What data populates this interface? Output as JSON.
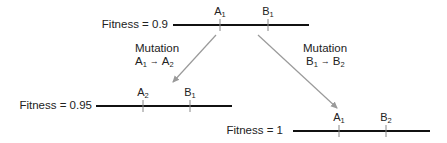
{
  "diagram": {
    "top": {
      "fitness_label": "Fitness = 0.9",
      "genes": [
        {
          "letter": "A",
          "sub": "1"
        },
        {
          "letter": "B",
          "sub": "1"
        }
      ]
    },
    "left": {
      "fitness_label": "Fitness = 0.95",
      "genes": [
        {
          "letter": "A",
          "sub": "2"
        },
        {
          "letter": "B",
          "sub": "1"
        }
      ]
    },
    "right": {
      "fitness_label": "Fitness = 1",
      "genes": [
        {
          "letter": "A",
          "sub": "1"
        },
        {
          "letter": "B",
          "sub": "2"
        }
      ]
    },
    "mutation_left": {
      "title": "Mutation",
      "from": {
        "letter": "A",
        "sub": "1"
      },
      "arrow": "→",
      "to": {
        "letter": "A",
        "sub": "2"
      }
    },
    "mutation_right": {
      "title": "Mutation",
      "from": {
        "letter": "B",
        "sub": "1"
      },
      "arrow": "→",
      "to": {
        "letter": "B",
        "sub": "2"
      }
    },
    "colors": {
      "line": "#111111",
      "arrow": "#9a9a9a",
      "text": "#222222"
    }
  }
}
